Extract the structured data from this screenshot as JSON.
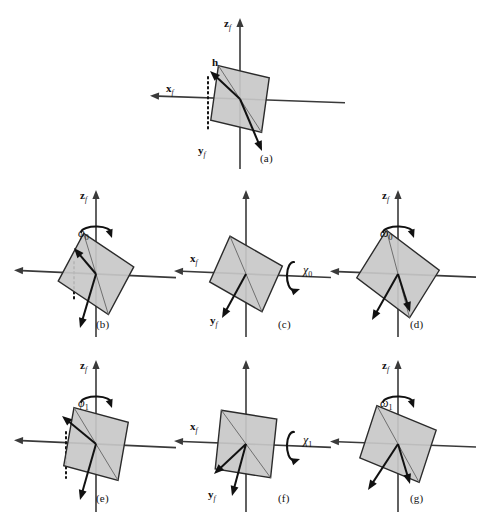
{
  "figure": {
    "type": "schematic-diagram",
    "background_color": "#ffffff",
    "plate_fill": "#c8c8c8",
    "axis_color": "#3a3a3a",
    "vector_color": "#111111",
    "axis_labels": {
      "z": "z",
      "x": "x",
      "y": "y",
      "h": "h"
    },
    "subscript_axis": "f"
  },
  "panels": [
    {
      "id": "a",
      "caption": "(a)",
      "shows_axis_labels": {
        "z": true,
        "x": true,
        "y": true
      },
      "shows_h_vector": true,
      "rotation_symbol": "",
      "rotation_sub": "",
      "rotation_axis": "",
      "dotted_line": true,
      "plate_tilt_deg": 8
    },
    {
      "id": "b",
      "caption": "(b)",
      "shows_axis_labels": {
        "z": true,
        "x": false,
        "y": false
      },
      "shows_h_vector": false,
      "rotation_symbol": "φ",
      "rotation_sub": "0",
      "rotation_axis": "z",
      "dotted_line": true,
      "plate_tilt_deg": 28
    },
    {
      "id": "c",
      "caption": "(c)",
      "shows_axis_labels": {
        "z": false,
        "x": true,
        "y": true
      },
      "shows_h_vector": false,
      "rotation_symbol": "χ",
      "rotation_sub": "0",
      "rotation_axis": "x",
      "dotted_line": false,
      "plate_tilt_deg": 24
    },
    {
      "id": "d",
      "caption": "(d)",
      "shows_axis_labels": {
        "z": true,
        "x": false,
        "y": false
      },
      "shows_h_vector": false,
      "rotation_symbol": "ω",
      "rotation_sub": "0",
      "rotation_axis": "z",
      "dotted_line": false,
      "plate_tilt_deg": 32
    },
    {
      "id": "e",
      "caption": "(e)",
      "shows_axis_labels": {
        "z": true,
        "x": false,
        "y": false
      },
      "shows_h_vector": false,
      "rotation_symbol": "φ",
      "rotation_sub": "1",
      "rotation_axis": "z",
      "dotted_line": true,
      "plate_tilt_deg": 10
    },
    {
      "id": "f",
      "caption": "(f)",
      "shows_axis_labels": {
        "z": false,
        "x": true,
        "y": true
      },
      "shows_h_vector": false,
      "rotation_symbol": "χ",
      "rotation_sub": "1",
      "rotation_axis": "x",
      "dotted_line": false,
      "plate_tilt_deg": 6
    },
    {
      "id": "g",
      "caption": "(g)",
      "shows_axis_labels": {
        "z": true,
        "x": false,
        "y": false
      },
      "shows_h_vector": false,
      "rotation_symbol": "ω",
      "rotation_sub": "1",
      "rotation_axis": "z",
      "dotted_line": false,
      "plate_tilt_deg": 18
    }
  ],
  "captions": {
    "a": "(a)",
    "b": "(b)",
    "c": "(c)",
    "d": "(d)",
    "e": "(e)",
    "f": "(f)",
    "g": "(g)"
  }
}
